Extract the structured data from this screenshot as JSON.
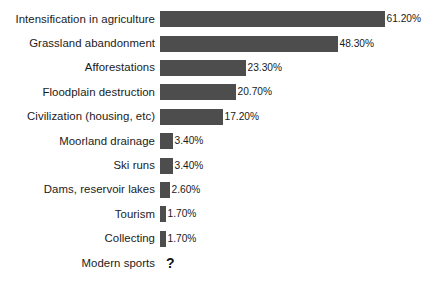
{
  "chart_data": {
    "type": "bar",
    "orientation": "horizontal",
    "title": "",
    "subtitle": "",
    "xlabel": "",
    "ylabel": "",
    "grid": false,
    "legend": null,
    "axis_visible": false,
    "value_suffix": "%",
    "xlim": [
      0,
      61.2
    ],
    "bar_color": "#4d4d4d",
    "text_color": "#1a1a1a",
    "background_color": "#ffffff",
    "categories": [
      "Intensification in agriculture",
      "Grassland abandonment",
      "Afforestations",
      "Floodplain destruction",
      "Civilization (housing, etc)",
      "Moorland drainage",
      "Ski runs",
      "Dams, reservoir lakes",
      "Tourism",
      "Collecting",
      "Modern sports"
    ],
    "values": [
      61.2,
      48.3,
      23.3,
      20.7,
      17.2,
      3.4,
      3.4,
      2.6,
      1.7,
      1.7,
      null
    ],
    "value_labels": [
      "61.20%",
      "48.30%",
      "23.30%",
      "20.70%",
      "17.20%",
      "3.40%",
      "3.40%",
      "2.60%",
      "1.70%",
      "1.70%",
      "?"
    ],
    "bars": [
      {
        "label": "Intensification in agriculture",
        "value": 61.2,
        "value_label": "61.20%",
        "pixel_width": 225
      },
      {
        "label": "Grassland abandonment",
        "value": 48.3,
        "value_label": "48.30%",
        "pixel_width": 178
      },
      {
        "label": "Afforestations",
        "value": 23.3,
        "value_label": "23.30%",
        "pixel_width": 86
      },
      {
        "label": "Floodplain destruction",
        "value": 20.7,
        "value_label": "20.70%",
        "pixel_width": 76
      },
      {
        "label": "Civilization (housing, etc)",
        "value": 17.2,
        "value_label": "17.20%",
        "pixel_width": 63
      },
      {
        "label": "Moorland drainage",
        "value": 3.4,
        "value_label": "3.40%",
        "pixel_width": 13
      },
      {
        "label": "Ski runs",
        "value": 3.4,
        "value_label": "3.40%",
        "pixel_width": 13
      },
      {
        "label": "Dams, reservoir lakes",
        "value": 2.6,
        "value_label": "2.60%",
        "pixel_width": 10
      },
      {
        "label": "Tourism",
        "value": 1.7,
        "value_label": "1.70%",
        "pixel_width": 6
      },
      {
        "label": "Collecting",
        "value": 1.7,
        "value_label": "1.70%",
        "pixel_width": 6
      },
      {
        "label": "Modern sports",
        "value": null,
        "value_label": "?",
        "pixel_width": 0
      }
    ]
  }
}
